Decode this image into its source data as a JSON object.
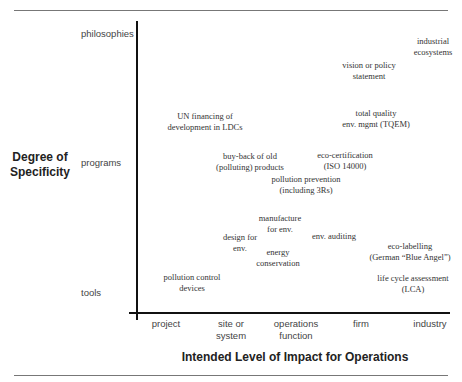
{
  "diagram": {
    "y_axis": {
      "title_line1": "Degree of",
      "title_line2": "Specificity",
      "levels": [
        "philosophies",
        "programs",
        "tools"
      ]
    },
    "x_axis": {
      "title": "Intended Level of Impact for Operations",
      "levels": [
        {
          "line1": "project",
          "line2": ""
        },
        {
          "line1": "site or",
          "line2": "system"
        },
        {
          "line1": "operations",
          "line2": "function"
        },
        {
          "line1": "firm",
          "line2": ""
        },
        {
          "line1": "industry",
          "line2": ""
        }
      ]
    },
    "items": [
      {
        "line1": "industrial",
        "line2": "ecosystems"
      },
      {
        "line1": "vision or policy",
        "line2": "statement"
      },
      {
        "line1": "UN financing of",
        "line2": "development in LDCs"
      },
      {
        "line1": "total quality",
        "line2": "env. mgmt (TQEM)"
      },
      {
        "line1": "buy-back of old",
        "line2": "(polluting) products"
      },
      {
        "line1": "eco-certification",
        "line2": "(ISO 14000)"
      },
      {
        "line1": "pollution prevention",
        "line2": "(including 3Rs)"
      },
      {
        "line1": "manufacture",
        "line2": "for env."
      },
      {
        "line1": "design for",
        "line2": "env."
      },
      {
        "line1": "env. auditing",
        "line2": ""
      },
      {
        "line1": "energy",
        "line2": "conservation"
      },
      {
        "line1": "eco-labelling",
        "line2": "(German “Blue Angel”)"
      },
      {
        "line1": "pollution control",
        "line2": "devices"
      },
      {
        "line1": "life cycle assessment",
        "line2": "(LCA)"
      }
    ]
  }
}
